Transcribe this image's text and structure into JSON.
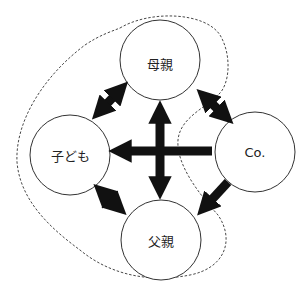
{
  "diagram": {
    "nodes": [
      {
        "id": "mother",
        "label": "母親",
        "cx": 160,
        "cy": 60,
        "r": 40
      },
      {
        "id": "child",
        "label": "子ども",
        "cx": 70,
        "cy": 155,
        "r": 40
      },
      {
        "id": "co",
        "label": "Co.",
        "cx": 255,
        "cy": 152,
        "r": 40
      },
      {
        "id": "father",
        "label": "父親",
        "cx": 161,
        "cy": 240,
        "r": 40
      }
    ],
    "edges": [
      {
        "from": "mother",
        "to": "child",
        "type": "bidirectional"
      },
      {
        "from": "mother",
        "to": "co",
        "type": "bidirectional"
      },
      {
        "from": "mother",
        "to": "father",
        "type": "bidirectional"
      },
      {
        "from": "child",
        "to": "father",
        "type": "bidirectional"
      },
      {
        "from": "co",
        "to": "child",
        "type": "directed"
      },
      {
        "from": "co",
        "to": "father",
        "type": "directed"
      }
    ],
    "boundary": {
      "style": "dashed",
      "encloses": [
        "mother",
        "child",
        "father"
      ]
    }
  }
}
